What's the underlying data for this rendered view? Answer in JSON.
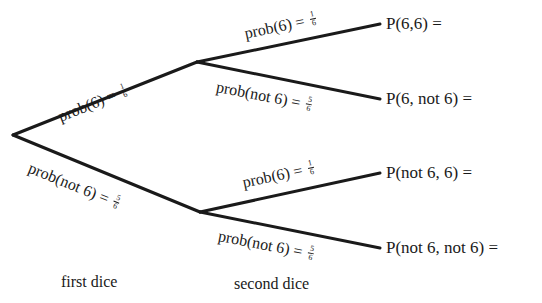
{
  "diagram": {
    "type": "probability-tree",
    "stroke_color": "#1a1a1a",
    "nodes": {
      "root": {
        "x": 13,
        "y": 135
      },
      "first_six": {
        "x": 197,
        "y": 62
      },
      "first_not_six": {
        "x": 200,
        "y": 212
      }
    },
    "branches": {
      "first_six": {
        "label": "prob(6) =",
        "num": "1",
        "den": "6"
      },
      "first_not_six": {
        "label": "prob(not 6) =",
        "num": "5",
        "den": "6"
      },
      "six_six": {
        "label": "prob(6) =",
        "num": "1",
        "den": "6"
      },
      "six_not_six": {
        "label": "prob(not 6) =",
        "num": "5",
        "den": "6"
      },
      "not_six_six": {
        "label": "prob(6) =",
        "num": "1",
        "den": "6"
      },
      "not_six_not_six": {
        "label": "prob(not 6) =",
        "num": "5",
        "den": "6"
      }
    },
    "outcomes": [
      {
        "label": "P(6,6) ="
      },
      {
        "label": "P(6, not 6) ="
      },
      {
        "label": "P(not 6, 6) ="
      },
      {
        "label": "P(not 6, not 6) ="
      }
    ],
    "stages": {
      "first": "first dice",
      "second": "second dice"
    }
  }
}
